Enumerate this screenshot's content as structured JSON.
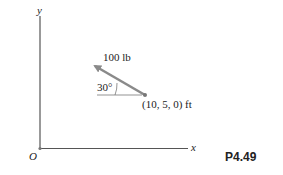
{
  "diagram": {
    "axes": {
      "x_label": "x",
      "y_label": "y",
      "origin_label": "O"
    },
    "force": {
      "magnitude_label": "100 lb",
      "angle_label": "30°",
      "point_label": "(10, 5, 0) ft"
    },
    "figure_id": "P4.49",
    "colors": {
      "arrow": "#8a8a8a",
      "axis": "#555555",
      "text": "#222222"
    }
  }
}
